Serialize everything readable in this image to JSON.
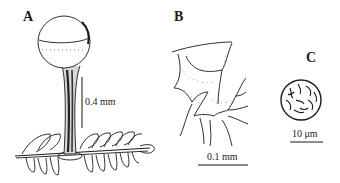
{
  "figure": {
    "panels": [
      {
        "label": "A",
        "subject": "stalked sporangium on leaf substrate",
        "scale_bar": {
          "label": "0.4 mm",
          "orientation": "vertical"
        }
      },
      {
        "label": "B",
        "subject": "capillitium network",
        "scale_bar": {
          "label": "0.1 mm",
          "orientation": "horizontal"
        }
      },
      {
        "label": "C",
        "subject": "spore with ornamented surface",
        "scale_bar": {
          "label": "10 μm",
          "orientation": "horizontal"
        }
      }
    ],
    "colors": {
      "ink": "#1a1a1a",
      "background": "#ffffff"
    }
  }
}
